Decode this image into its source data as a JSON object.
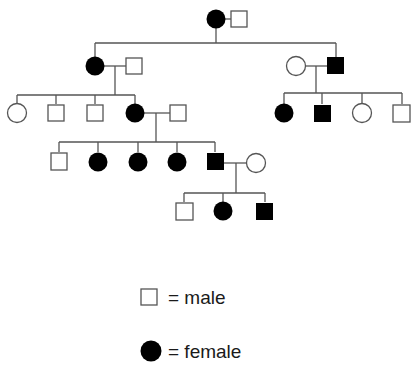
{
  "diagram": {
    "type": "pedigree",
    "colors": {
      "line": "#555555",
      "affected": "#000000",
      "unaffected_fill": "#ffffff",
      "stroke": "#555555"
    },
    "generations": [
      {
        "id": "I",
        "individuals": [
          {
            "id": "I-1",
            "sex": "female",
            "affected": true
          },
          {
            "id": "I-2",
            "sex": "male",
            "affected": false
          }
        ]
      },
      {
        "id": "II",
        "individuals": [
          {
            "id": "II-1",
            "sex": "female",
            "affected": true
          },
          {
            "id": "II-2",
            "sex": "male",
            "affected": false,
            "note": "spouse"
          },
          {
            "id": "II-3",
            "sex": "female",
            "affected": false,
            "note": "spouse"
          },
          {
            "id": "II-4",
            "sex": "male",
            "affected": true
          }
        ]
      },
      {
        "id": "III",
        "individuals": [
          {
            "id": "III-1",
            "sex": "female",
            "affected": false
          },
          {
            "id": "III-2",
            "sex": "male",
            "affected": false
          },
          {
            "id": "III-3",
            "sex": "male",
            "affected": false
          },
          {
            "id": "III-4",
            "sex": "female",
            "affected": true
          },
          {
            "id": "III-5",
            "sex": "male",
            "affected": false,
            "note": "spouse"
          },
          {
            "id": "III-6",
            "sex": "female",
            "affected": true
          },
          {
            "id": "III-7",
            "sex": "male",
            "affected": true
          },
          {
            "id": "III-8",
            "sex": "female",
            "affected": false
          },
          {
            "id": "III-9",
            "sex": "male",
            "affected": false
          }
        ]
      },
      {
        "id": "IV",
        "individuals": [
          {
            "id": "IV-1",
            "sex": "male",
            "affected": false
          },
          {
            "id": "IV-2",
            "sex": "female",
            "affected": true
          },
          {
            "id": "IV-3",
            "sex": "female",
            "affected": true
          },
          {
            "id": "IV-4",
            "sex": "female",
            "affected": true
          },
          {
            "id": "IV-5",
            "sex": "male",
            "affected": true
          },
          {
            "id": "IV-6",
            "sex": "female",
            "affected": false,
            "note": "spouse"
          }
        ]
      },
      {
        "id": "V",
        "individuals": [
          {
            "id": "V-1",
            "sex": "male",
            "affected": false
          },
          {
            "id": "V-2",
            "sex": "female",
            "affected": true
          },
          {
            "id": "V-3",
            "sex": "male",
            "affected": true
          }
        ]
      }
    ]
  },
  "legend": {
    "male_label": "= male",
    "female_label": "= female"
  }
}
